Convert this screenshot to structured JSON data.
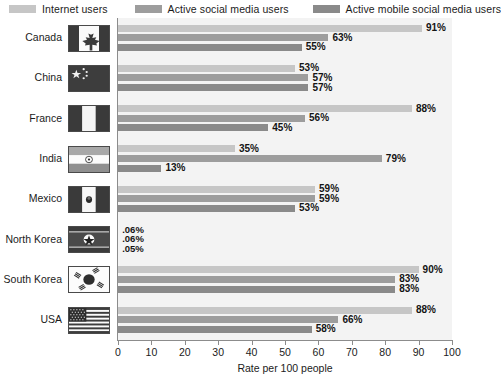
{
  "legend": {
    "items": [
      {
        "label": "Internet users",
        "color": "#c6c6c6",
        "key": "internet_users"
      },
      {
        "label": "Active social media users",
        "color": "#9d9d9d",
        "key": "active_social_media_users"
      },
      {
        "label": "Active mobile social media users",
        "color": "#8a8a8a",
        "key": "active_mobile_social_media_users"
      }
    ]
  },
  "axis": {
    "x_title": "Rate per 100 people",
    "x_ticks": [
      "0",
      "10",
      "20",
      "30",
      "40",
      "50",
      "60",
      "70",
      "80",
      "90",
      "100"
    ]
  },
  "rows": [
    {
      "country": "Canada",
      "flag": "flag-canada",
      "values": [
        "91%",
        "63%",
        "55%"
      ],
      "nums": [
        91,
        63,
        55
      ]
    },
    {
      "country": "China",
      "flag": "flag-china",
      "values": [
        "53%",
        "57%",
        "57%"
      ],
      "nums": [
        53,
        57,
        57
      ]
    },
    {
      "country": "France",
      "flag": "flag-france",
      "values": [
        "88%",
        "56%",
        "45%"
      ],
      "nums": [
        88,
        56,
        45
      ]
    },
    {
      "country": "India",
      "flag": "flag-india",
      "values": [
        "35%",
        "79%",
        "13%"
      ],
      "nums": [
        35,
        79,
        13
      ]
    },
    {
      "country": "Mexico",
      "flag": "flag-mexico",
      "values": [
        "59%",
        "59%",
        "53%"
      ],
      "nums": [
        59,
        59,
        53
      ]
    },
    {
      "country": "North Korea",
      "flag": "flag-north-korea",
      "values": [
        ".06%",
        ".06%",
        ".05%"
      ],
      "nums": [
        0.06,
        0.06,
        0.05
      ]
    },
    {
      "country": "South Korea",
      "flag": "flag-south-korea",
      "values": [
        "90%",
        "83%",
        "83%"
      ],
      "nums": [
        90,
        83,
        83
      ]
    },
    {
      "country": "USA",
      "flag": "flag-usa",
      "values": [
        "88%",
        "66%",
        "58%"
      ],
      "nums": [
        88,
        66,
        58
      ]
    }
  ],
  "chart_data": {
    "type": "bar",
    "orientation": "horizontal",
    "title": "",
    "xlabel": "Rate per 100 people",
    "ylabel": "",
    "xlim": [
      0,
      100
    ],
    "xticks": [
      0,
      10,
      20,
      30,
      40,
      50,
      60,
      70,
      80,
      90,
      100
    ],
    "grid": false,
    "legend_position": "top",
    "categories": [
      "Canada",
      "China",
      "France",
      "India",
      "Mexico",
      "North Korea",
      "South Korea",
      "USA"
    ],
    "series": [
      {
        "name": "Internet users",
        "color": "#c6c6c6",
        "values": [
          91,
          53,
          88,
          35,
          59,
          0.06,
          90,
          88
        ],
        "labels": [
          "91%",
          "53%",
          "88%",
          "35%",
          "59%",
          ".06%",
          "90%",
          "88%"
        ]
      },
      {
        "name": "Active social media users",
        "color": "#9d9d9d",
        "values": [
          63,
          57,
          56,
          79,
          59,
          0.06,
          83,
          66
        ],
        "labels": [
          "63%",
          "57%",
          "56%",
          "79%",
          "59%",
          ".06%",
          "83%",
          "66%"
        ]
      },
      {
        "name": "Active mobile social media users",
        "color": "#8a8a8a",
        "values": [
          55,
          57,
          45,
          13,
          53,
          0.05,
          83,
          58
        ],
        "labels": [
          "55%",
          "57%",
          "45%",
          "13%",
          "53%",
          ".05%",
          "83%",
          "58%"
        ]
      }
    ]
  }
}
